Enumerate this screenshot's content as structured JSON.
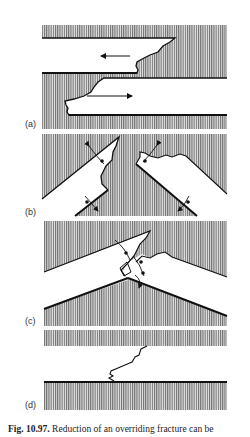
{
  "figure": {
    "panels": [
      {
        "label": "(a)"
      },
      {
        "label": "(b)"
      },
      {
        "label": "(c)"
      },
      {
        "label": "(d)"
      }
    ],
    "caption": {
      "number": "Fig. 10.97.",
      "text": "Reduction of an overriding fracture can be"
    }
  }
}
